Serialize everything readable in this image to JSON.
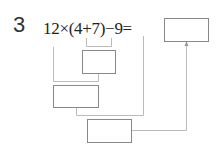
{
  "problem": {
    "number": "3",
    "expression": "12×(4+7)−9=",
    "answer_box": "",
    "step_boxes": [
      "",
      "",
      ""
    ]
  },
  "colors": {
    "line": "#bbbbbb",
    "box_border": "#888888"
  }
}
